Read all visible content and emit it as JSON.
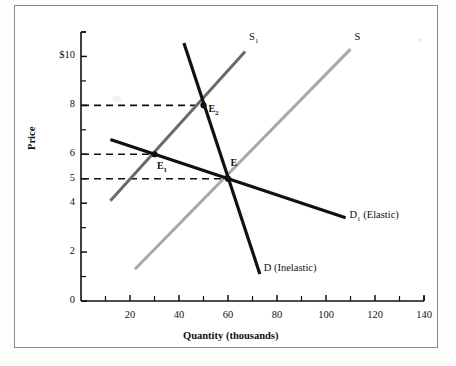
{
  "chart_data": {
    "type": "line",
    "title": "",
    "xlabel": "Quantity (thousands)",
    "ylabel": "Price",
    "xlim": [
      0,
      140
    ],
    "ylim": [
      0,
      11
    ],
    "grid": false,
    "legend": "inline-curve-labels",
    "xticks": [
      {
        "value": 20,
        "label": "20"
      },
      {
        "value": 40,
        "label": "40"
      },
      {
        "value": 60,
        "label": "60"
      },
      {
        "value": 80,
        "label": "80"
      },
      {
        "value": 100,
        "label": "100"
      },
      {
        "value": 120,
        "label": "120"
      },
      {
        "value": 140,
        "label": "140"
      }
    ],
    "xminorticks": [
      10,
      30,
      50,
      70,
      90,
      110,
      130
    ],
    "yticks": [
      {
        "value": 0,
        "label": "0"
      },
      {
        "value": 2,
        "label": "2"
      },
      {
        "value": 4,
        "label": "4"
      },
      {
        "value": 5,
        "label": "5"
      },
      {
        "value": 6,
        "label": "6"
      },
      {
        "value": 8,
        "label": "8"
      },
      {
        "value": 10,
        "label": "$10"
      }
    ],
    "yminorticks": [
      1,
      3,
      7,
      9,
      11
    ],
    "series": [
      {
        "name": "S",
        "label": "S",
        "label_main": "S",
        "label_sub": "",
        "color": "#a9a9a4",
        "width": 3,
        "points": [
          [
            22,
            1.3
          ],
          [
            110,
            10.3
          ]
        ],
        "label_at": [
          112,
          10.7
        ]
      },
      {
        "name": "S1",
        "label": "S1",
        "label_main": "S",
        "label_sub": "1",
        "color": "#6a6a66",
        "width": 3,
        "points": [
          [
            12,
            4.1
          ],
          [
            67,
            10.2
          ]
        ],
        "label_at": [
          69,
          10.7
        ]
      },
      {
        "name": "D",
        "label": "D (Inelastic)",
        "label_main": "D (Inelastic)",
        "label_sub": "",
        "color": "#111111",
        "width": 3.2,
        "points": [
          [
            42,
            10.55
          ],
          [
            73,
            1.1
          ]
        ],
        "label_at": [
          75,
          1.25
        ]
      },
      {
        "name": "D1",
        "label": "D1 (Elastic)",
        "label_main": "D",
        "label_sub": "1",
        "label_tail": " (Elastic)",
        "color": "#111111",
        "width": 3.2,
        "points": [
          [
            12,
            6.6
          ],
          [
            108,
            3.4
          ]
        ],
        "label_at": [
          110,
          3.45
        ]
      }
    ],
    "equilibria": [
      {
        "name": "E1",
        "label_main": "E",
        "label_sub": "1",
        "x": 30,
        "y": 6,
        "label_at": [
          31,
          5.45
        ]
      },
      {
        "name": "E2",
        "label_main": "E",
        "label_sub": "2",
        "x": 50,
        "y": 8,
        "label_at": [
          52,
          7.75
        ]
      },
      {
        "name": "E",
        "label_main": "E",
        "label_sub": "",
        "x": 60,
        "y": 5,
        "label_at": [
          61,
          5.55
        ]
      }
    ],
    "guide_lines": [
      {
        "name": "price-8-guide",
        "price": 8,
        "from_x": 0,
        "to_x": 50,
        "style": "dashed"
      },
      {
        "name": "price-6-guide",
        "price": 6,
        "from_x": 0,
        "to_x": 30,
        "style": "dashed"
      },
      {
        "name": "price-5-guide",
        "price": 5,
        "from_x": 0,
        "to_x": 60,
        "style": "dashed"
      }
    ]
  }
}
